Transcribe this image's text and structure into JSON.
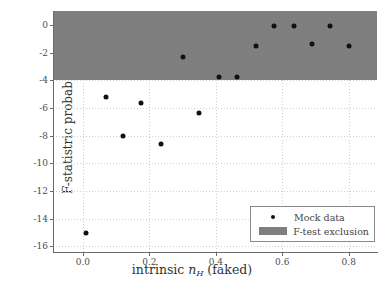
{
  "chart_data": {
    "type": "scatter",
    "title": "",
    "xlabel": "intrinsic n_H (faked)",
    "xlabel_parts": {
      "prefix": "intrinsic ",
      "var": "n",
      "sub": "H",
      "suffix": " (faked)"
    },
    "ylabel": "F-statistric probability",
    "xlim": [
      -0.09,
      0.885
    ],
    "ylim": [
      -16.4,
      1.0
    ],
    "xticks": [
      0.0,
      0.2,
      0.4,
      0.6,
      0.8
    ],
    "xticklabels": [
      "0.0",
      "0.2",
      "0.4",
      "0.6",
      "0.8"
    ],
    "yticks": [
      0,
      -2,
      -4,
      -6,
      -8,
      -10,
      -12,
      -14,
      -16
    ],
    "yticklabels": [
      "0",
      "-2",
      "-4",
      "-6",
      "-8",
      "-10",
      "-12",
      "-14",
      "-16"
    ],
    "grid": true,
    "grid_style": "dotted",
    "legend_position": "lower right",
    "series": [
      {
        "name": "Mock data",
        "type": "scatter",
        "marker": "circle",
        "color": "#111111",
        "x": [
          0.01,
          0.07,
          0.12,
          0.175,
          0.235,
          0.3,
          0.35,
          0.41,
          0.465,
          0.52,
          0.575,
          0.635,
          0.69,
          0.745,
          0.8
        ],
        "y": [
          -15.0,
          -5.2,
          -8.0,
          -5.65,
          -8.6,
          -2.35,
          -6.4,
          -3.75,
          -3.8,
          -1.5,
          -0.05,
          -0.05,
          -1.4,
          -0.05,
          -1.55
        ]
      },
      {
        "name": "F-test exclusion",
        "type": "band",
        "color": "#7f7f7f",
        "y_range": [
          -4.0,
          1.0
        ]
      }
    ],
    "annotations": []
  },
  "legend": {
    "entries": [
      {
        "label": "Mock data",
        "key": "dot-marker"
      },
      {
        "label": "F-test exclusion",
        "key": "gray-patch"
      }
    ]
  },
  "colors": {
    "band": "#7f7f7f",
    "marker": "#111111",
    "axis": "#6b6b6b",
    "grid": "#d0d0d0",
    "text": "#4d4d4d",
    "background": "#ffffff"
  }
}
